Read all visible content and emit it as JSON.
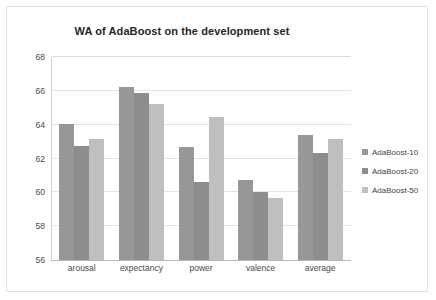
{
  "chart_data": {
    "type": "bar",
    "title": "WA of AdaBoost on the development set",
    "xlabel": "",
    "ylabel": "",
    "ylim": [
      56,
      68
    ],
    "yticks": [
      56,
      58,
      60,
      62,
      64,
      66,
      68
    ],
    "grid": true,
    "legend_position": "right",
    "categories": [
      "arousal",
      "expectancy",
      "power",
      "valence",
      "average"
    ],
    "series": [
      {
        "name": "AdaBoost-10",
        "color": "#979797",
        "values": [
          64.05,
          66.2,
          62.7,
          60.75,
          63.4
        ]
      },
      {
        "name": "AdaBoost-20",
        "color": "#8d8d8d",
        "values": [
          62.75,
          65.85,
          60.6,
          60.0,
          62.3
        ]
      },
      {
        "name": "AdaBoost-50",
        "color": "#bfbfbf",
        "values": [
          63.15,
          65.25,
          64.45,
          59.65,
          63.15
        ]
      }
    ]
  },
  "axis": {
    "y_tick_labels": [
      "68",
      "66",
      "64",
      "62",
      "60",
      "58",
      "56"
    ]
  },
  "legend": {
    "items": [
      {
        "label": "AdaBoost-10",
        "color": "#979797"
      },
      {
        "label": "AdaBoost-20",
        "color": "#8d8d8d"
      },
      {
        "label": "AdaBoost-50",
        "color": "#bfbfbf"
      }
    ]
  }
}
